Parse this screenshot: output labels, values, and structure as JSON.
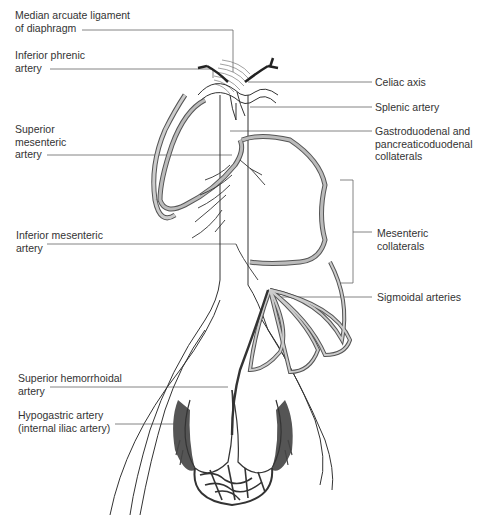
{
  "figure": {
    "colors": {
      "line": "#3a3a3a",
      "collateral_fill": "#b8b8b8",
      "hypogastric_fill": "#555555",
      "background": "#ffffff"
    }
  },
  "labels": {
    "left": [
      {
        "id": "median-arcuate",
        "lines": [
          "Median arcuate ligament",
          "of diaphragm"
        ]
      },
      {
        "id": "inferior-phrenic",
        "lines": [
          "Inferior phrenic",
          "artery"
        ]
      },
      {
        "id": "superior-mesenteric",
        "lines": [
          "Superior",
          "mesenteric",
          "artery"
        ]
      },
      {
        "id": "inferior-mesenteric",
        "lines": [
          "Inferior mesenteric",
          "artery"
        ]
      },
      {
        "id": "superior-hemorrhoidal",
        "lines": [
          "Superior hemorrhoidal",
          "artery"
        ]
      },
      {
        "id": "hypogastric",
        "lines": [
          "Hypogastric artery",
          "(internal iliac artery)"
        ]
      }
    ],
    "right": [
      {
        "id": "celiac-axis",
        "lines": [
          "Celiac axis"
        ]
      },
      {
        "id": "splenic",
        "lines": [
          "Splenic artery"
        ]
      },
      {
        "id": "gastroduodenal",
        "lines": [
          "Gastroduodenal and",
          "pancreaticoduodenal",
          "collaterals"
        ]
      },
      {
        "id": "mesenteric-collaterals",
        "lines": [
          "Mesenteric",
          "collaterals"
        ]
      },
      {
        "id": "sigmoidal",
        "lines": [
          "Sigmoidal arteries"
        ]
      }
    ]
  }
}
